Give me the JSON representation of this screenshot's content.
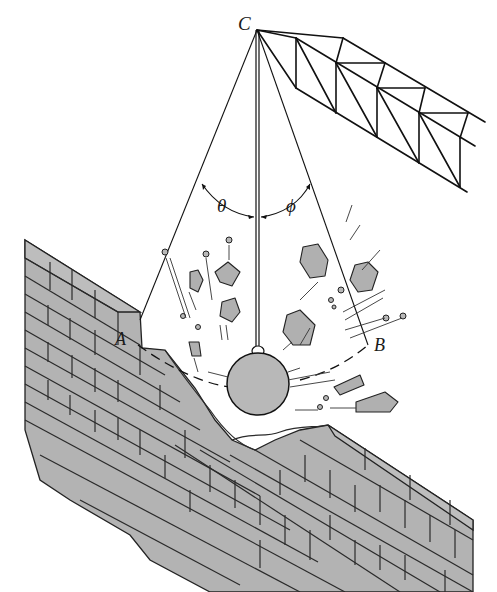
{
  "figure": {
    "labels": {
      "point_c": "C",
      "point_a": "A",
      "point_b": "B",
      "angle_theta": "θ",
      "angle_phi": "ϕ"
    },
    "colors": {
      "line": "#111111",
      "fill_gray": "#b3b3b3",
      "background": "#ffffff"
    }
  }
}
